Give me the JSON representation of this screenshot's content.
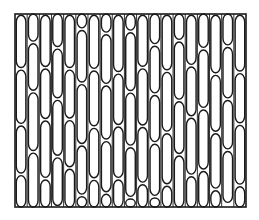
{
  "figure": {
    "title": "",
    "frame": {
      "x": 15,
      "y": 14,
      "width": 231,
      "height": 193
    },
    "columns": 19,
    "stroke_color": "#1a1a1a",
    "fill_color": "#ffffff",
    "background": "#ffffff"
  }
}
